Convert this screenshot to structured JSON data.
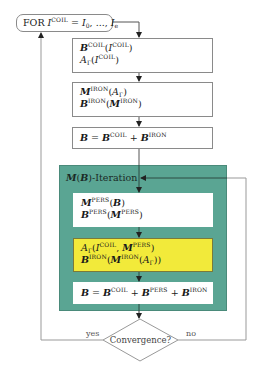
{
  "diagram": {
    "loop_start": {
      "prefix": "FOR ",
      "var": "I",
      "var_sup": "COIL",
      "eq": " = ",
      "range_start": "I",
      "range_start_sub": "0",
      "range_sep": ", ..., ",
      "range_end": "I",
      "range_end_sub": "e"
    },
    "box1": {
      "line1": {
        "sym": "B",
        "sup": "COIL",
        "arg": "I",
        "arg_sup": "COIL"
      },
      "line2": {
        "sym": "A",
        "sub": "Γ",
        "arg": "I",
        "arg_sup": "COIL"
      }
    },
    "box2": {
      "line1": {
        "sym": "M",
        "sup": "IRON",
        "arg": "A",
        "arg_sub": "Γ"
      },
      "line2": {
        "sym": "B",
        "sup": "IRON",
        "arg": "M",
        "arg_sup": "IRON"
      }
    },
    "box3": {
      "lhs": "B",
      "eq": " = ",
      "t1": "B",
      "t1_sup": "COIL",
      "plus": " + ",
      "t2": "B",
      "t2_sup": "IRON"
    },
    "iteration": {
      "title_sym": "M",
      "title_arg": "B",
      "title_suffix": "-Iteration",
      "colors": {
        "container": "#5aa593",
        "highlight": "#f2ea3a"
      },
      "box4": {
        "line1": {
          "sym": "M",
          "sup": "PERS",
          "arg": "B"
        },
        "line2": {
          "sym": "B",
          "sup": "PERS",
          "arg": "M",
          "arg_sup": "PERS"
        }
      },
      "box5": {
        "line1": {
          "sym": "A",
          "sub": "Γ",
          "arg1": "I",
          "arg1_sup": "COIL",
          "arg2": "M",
          "arg2_sup": "PERS"
        },
        "line2": {
          "sym": "B",
          "sup": "IRON",
          "inner": "M",
          "inner_sup": "IRON",
          "innermost": "A",
          "innermost_sub": "Γ"
        }
      },
      "box6": {
        "lhs": "B",
        "eq": " = ",
        "t1": "B",
        "t1_sup": "COIL",
        "plus1": " + ",
        "t2": "B",
        "t2_sup": "PERS",
        "plus2": " + ",
        "t3": "B",
        "t3_sup": "IRON"
      }
    },
    "decision": {
      "label": "Convergence?",
      "yes": "yes",
      "no": "no"
    }
  }
}
